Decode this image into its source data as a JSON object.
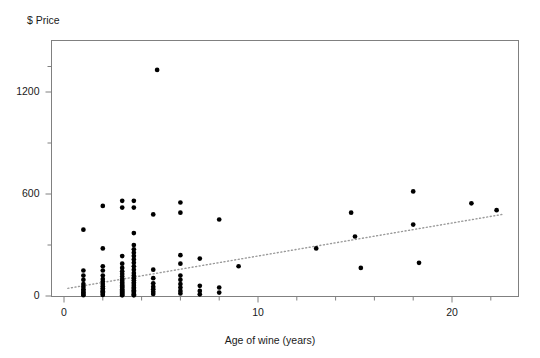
{
  "chart_data": {
    "type": "scatter",
    "title": "",
    "xlabel": "Age of wine (years)",
    "ylabel": "$ Price",
    "xlim": [
      -0.4,
      23.5
    ],
    "ylim": [
      -40,
      1420
    ],
    "xticks": [
      0,
      10,
      20
    ],
    "xtick_labels": [
      "0",
      "10",
      "20"
    ],
    "xminor_ticks": [
      2,
      4,
      6,
      8,
      12,
      14,
      16,
      18,
      22
    ],
    "yticks": [
      0,
      600,
      1200
    ],
    "ytick_labels": [
      "0",
      "600",
      "1200"
    ],
    "yminor_ticks": [
      300,
      900,
      1350
    ],
    "grid": false,
    "legend": null,
    "marker": "filled-circle",
    "marker_color": "#000000",
    "frame_color": "#808080",
    "trendline": {
      "style": "dotted",
      "color": "#9a9a9a",
      "x": [
        0.2,
        22.6
      ],
      "y": [
        45,
        480
      ]
    },
    "points": [
      [
        1.0,
        390
      ],
      [
        1.0,
        150
      ],
      [
        1.0,
        120
      ],
      [
        1.0,
        95
      ],
      [
        1.0,
        70
      ],
      [
        1.0,
        55
      ],
      [
        1.0,
        40
      ],
      [
        1.0,
        30
      ],
      [
        1.0,
        20
      ],
      [
        1.0,
        12
      ],
      [
        1.0,
        5
      ],
      [
        2.0,
        530
      ],
      [
        2.0,
        280
      ],
      [
        2.0,
        175
      ],
      [
        2.0,
        150
      ],
      [
        2.0,
        120
      ],
      [
        2.0,
        100
      ],
      [
        2.0,
        85
      ],
      [
        2.0,
        70
      ],
      [
        2.0,
        58
      ],
      [
        2.0,
        45
      ],
      [
        2.0,
        35
      ],
      [
        2.0,
        28
      ],
      [
        2.0,
        20
      ],
      [
        2.0,
        12
      ],
      [
        2.0,
        6
      ],
      [
        3.0,
        560
      ],
      [
        3.0,
        520
      ],
      [
        3.0,
        235
      ],
      [
        3.0,
        190
      ],
      [
        3.0,
        165
      ],
      [
        3.0,
        145
      ],
      [
        3.0,
        130
      ],
      [
        3.0,
        115
      ],
      [
        3.0,
        100
      ],
      [
        3.0,
        90
      ],
      [
        3.0,
        80
      ],
      [
        3.0,
        70
      ],
      [
        3.0,
        62
      ],
      [
        3.0,
        55
      ],
      [
        3.0,
        48
      ],
      [
        3.0,
        40
      ],
      [
        3.0,
        33
      ],
      [
        3.0,
        26
      ],
      [
        3.0,
        20
      ],
      [
        3.0,
        14
      ],
      [
        3.0,
        8
      ],
      [
        3.0,
        4
      ],
      [
        3.6,
        560
      ],
      [
        3.6,
        520
      ],
      [
        3.6,
        370
      ],
      [
        3.6,
        300
      ],
      [
        3.6,
        275
      ],
      [
        3.6,
        255
      ],
      [
        3.6,
        235
      ],
      [
        3.6,
        215
      ],
      [
        3.6,
        195
      ],
      [
        3.6,
        175
      ],
      [
        3.6,
        155
      ],
      [
        3.6,
        135
      ],
      [
        3.6,
        120
      ],
      [
        3.6,
        105
      ],
      [
        3.6,
        92
      ],
      [
        3.6,
        80
      ],
      [
        3.6,
        70
      ],
      [
        3.6,
        60
      ],
      [
        3.6,
        50
      ],
      [
        3.6,
        42
      ],
      [
        3.6,
        34
      ],
      [
        3.6,
        26
      ],
      [
        3.6,
        18
      ],
      [
        3.6,
        10
      ],
      [
        3.6,
        4
      ],
      [
        4.8,
        1330
      ],
      [
        4.6,
        480
      ],
      [
        4.6,
        155
      ],
      [
        4.6,
        105
      ],
      [
        4.6,
        75
      ],
      [
        4.6,
        55
      ],
      [
        4.6,
        40
      ],
      [
        4.6,
        25
      ],
      [
        4.6,
        12
      ],
      [
        6.0,
        550
      ],
      [
        6.0,
        490
      ],
      [
        6.0,
        240
      ],
      [
        6.0,
        190
      ],
      [
        6.0,
        120
      ],
      [
        6.0,
        95
      ],
      [
        6.0,
        70
      ],
      [
        6.0,
        50
      ],
      [
        6.0,
        30
      ],
      [
        6.0,
        15
      ],
      [
        7.0,
        220
      ],
      [
        7.0,
        60
      ],
      [
        7.0,
        30
      ],
      [
        7.0,
        10
      ],
      [
        8.0,
        450
      ],
      [
        8.0,
        50
      ],
      [
        8.0,
        20
      ],
      [
        9.0,
        175
      ],
      [
        13.0,
        280
      ],
      [
        14.8,
        490
      ],
      [
        15.0,
        350
      ],
      [
        15.3,
        165
      ],
      [
        18.0,
        615
      ],
      [
        18.0,
        420
      ],
      [
        18.3,
        195
      ],
      [
        21.0,
        545
      ],
      [
        22.3,
        505
      ]
    ]
  }
}
